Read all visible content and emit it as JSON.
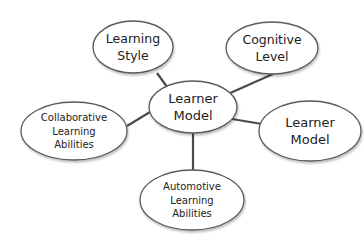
{
  "diagram": {
    "type": "mind-map",
    "colors": {
      "background": "#ffffff",
      "ellipse_stroke": "#5a5a5a",
      "edge": "#4a4a4a",
      "text": "#222222"
    },
    "center": {
      "id": "learner-model-center",
      "lines": [
        "Learner",
        "Model"
      ],
      "cx": 193,
      "cy": 107,
      "rx": 44,
      "ry": 26,
      "font_size": 13
    },
    "nodes": [
      {
        "id": "learning-style",
        "lines": [
          "Learning",
          "Style"
        ],
        "cx": 133,
        "cy": 47,
        "rx": 40,
        "ry": 26,
        "font_size": 12.5,
        "edge_from": [
          157,
          73
        ],
        "edge_to": [
          170,
          91
        ]
      },
      {
        "id": "cognitive-level",
        "lines": [
          "Cognitive",
          "Level"
        ],
        "cx": 272,
        "cy": 48,
        "rx": 46,
        "ry": 26,
        "font_size": 12.5,
        "edge_from": [
          273,
          74
        ],
        "edge_to": [
          228,
          94
        ]
      },
      {
        "id": "collaborative-learning-abilities",
        "lines": [
          "Collaborative",
          "Learning",
          "Abilities"
        ],
        "cx": 74,
        "cy": 131,
        "rx": 53,
        "ry": 29,
        "font_size": 10,
        "edge_from": [
          127,
          126
        ],
        "edge_to": [
          150,
          112
        ]
      },
      {
        "id": "learner-model-right",
        "lines": [
          "Learner",
          "Model"
        ],
        "cx": 310,
        "cy": 131,
        "rx": 51,
        "ry": 30,
        "font_size": 13,
        "edge_from": [
          262,
          124
        ],
        "edge_to": [
          232,
          119
        ]
      },
      {
        "id": "automotive-learning-abilities",
        "lines": [
          "Automotive",
          "Learning",
          "Abilities"
        ],
        "cx": 192,
        "cy": 200,
        "rx": 52,
        "ry": 30,
        "font_size": 10,
        "edge_from": [
          193,
          133
        ],
        "edge_to": [
          193,
          171
        ]
      }
    ]
  }
}
